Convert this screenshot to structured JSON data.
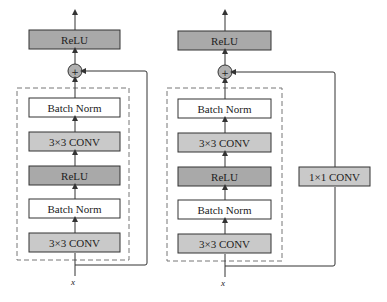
{
  "caption_fragment": "（cropped Chinese caption text line at top of page）",
  "colors": {
    "relu_fill": "#a9a9a9",
    "conv_fill": "#c9c9c9",
    "bn_fill": "#ffffff",
    "stroke": "#333333",
    "dashed": "#777777",
    "add_fill": "#b0b0b0"
  },
  "left_block": {
    "output_layer": "ReLU",
    "add_symbol": "+",
    "layers": [
      "Batch Norm",
      "3×3 CONV",
      "ReLU",
      "Batch Norm",
      "3×3 CONV"
    ],
    "input_label": "x",
    "shortcut": "identity"
  },
  "right_block": {
    "output_layer": "ReLU",
    "add_symbol": "+",
    "layers": [
      "Batch Norm",
      "3×3 CONV",
      "ReLU",
      "Batch Norm",
      "3×3 CONV"
    ],
    "input_label": "x",
    "shortcut": "1×1 CONV"
  }
}
